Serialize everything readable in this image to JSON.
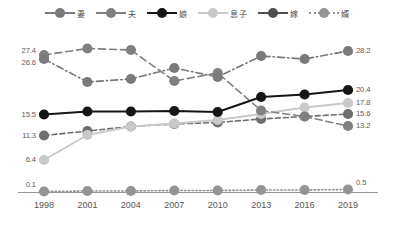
{
  "chart_data": {
    "type": "line",
    "title": "",
    "xlabel": "",
    "ylabel": "",
    "categories": [
      "1998",
      "2001",
      "2004",
      "2007",
      "2010",
      "2013",
      "2016",
      "2019"
    ],
    "ylim": [
      0,
      30
    ],
    "grid": false,
    "legend_position": "top",
    "series": [
      {
        "name": "妻",
        "color": "#7a7a7a",
        "line_style": "dash-dot",
        "values": [
          26.6,
          22.0,
          22.6,
          24.8,
          23.0,
          27.2,
          26.6,
          28.2
        ],
        "start_label": "26.6",
        "end_label": "28.2"
      },
      {
        "name": "夫",
        "color": "#808080",
        "line_style": "dashed-long",
        "values": [
          27.4,
          28.7,
          28.4,
          22.2,
          23.8,
          16.3,
          15.1,
          13.2
        ],
        "start_label": "27.4",
        "end_label": "13.2"
      },
      {
        "name": "娘",
        "color": "#161616",
        "line_style": "solid",
        "values": [
          15.5,
          16.1,
          16.1,
          16.2,
          16.0,
          19.0,
          19.5,
          20.4
        ],
        "start_label": "15.5",
        "end_label": "20.4"
      },
      {
        "name": "息子",
        "color": "#c9c9c9",
        "line_style": "solid",
        "values": [
          6.4,
          11.4,
          13.1,
          13.7,
          14.4,
          15.6,
          16.9,
          17.8
        ],
        "start_label": "6.4",
        "end_label": "17.8"
      },
      {
        "name": "嫁",
        "color": "#6f6f6f",
        "line_style": "dashed",
        "values": [
          11.3,
          12.2,
          13.1,
          13.6,
          13.9,
          14.6,
          15.1,
          15.6
        ],
        "start_label": "11.3",
        "end_label": "15.6"
      },
      {
        "name": "婿",
        "color": "#949494",
        "line_style": "dotted",
        "values": [
          0.1,
          0.2,
          0.2,
          0.3,
          0.3,
          0.4,
          0.4,
          0.5
        ],
        "start_label": "0.1",
        "end_label": "0.5"
      }
    ]
  },
  "legend": {
    "items": [
      {
        "label": "妻",
        "color": "#7a7a7a",
        "style": "dash-dot"
      },
      {
        "label": "夫",
        "color": "#808080",
        "style": "dashed-long"
      },
      {
        "label": "娘",
        "color": "#161616",
        "style": "solid"
      },
      {
        "label": "息子",
        "color": "#c9c9c9",
        "style": "solid"
      },
      {
        "label": "嫁",
        "color": "#4f4f4f",
        "style": "solid"
      },
      {
        "label": "婿",
        "color": "#949494",
        "style": "dotted"
      }
    ]
  },
  "axis": {
    "baseline_color": "#8a8a8a",
    "x_tick_labels": [
      "1998",
      "2001",
      "2004",
      "2007",
      "2010",
      "2013",
      "2016",
      "2019"
    ]
  },
  "value_labels": {
    "left": [
      "27.4",
      "26.6",
      "15.5",
      "11.3",
      "6.4",
      "0.1"
    ],
    "right": [
      "28.2",
      "20.4",
      "17.8",
      "15.6",
      "13.2",
      "0.5"
    ]
  }
}
